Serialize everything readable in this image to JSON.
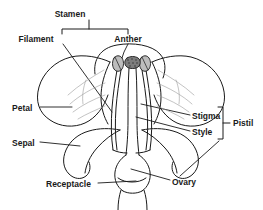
{
  "diagram": {
    "style": "black and white line art",
    "colors": {
      "outline": "#1a1a1a",
      "leader": "#1a1a1a",
      "vein": "#9a9a9a",
      "anther_fill": "#8c8c8c",
      "stigma_fill": "#6e6e6e",
      "background": "#ffffff"
    },
    "labels": [
      {
        "id": "stamen",
        "text": "Stamen",
        "x": 89,
        "y": 14,
        "anchor": "middle"
      },
      {
        "id": "filament",
        "text": "Filament",
        "x": 62,
        "y": 39,
        "anchor": "middle"
      },
      {
        "id": "anther",
        "text": "Anther",
        "x": 128,
        "y": 39,
        "anchor": "middle"
      },
      {
        "id": "petal",
        "text": "Petal",
        "x": 12,
        "y": 108,
        "anchor": "start"
      },
      {
        "id": "sepal",
        "text": "Sepal",
        "x": 12,
        "y": 143,
        "anchor": "start"
      },
      {
        "id": "receptacle",
        "text": "Receptacle",
        "x": 46,
        "y": 184,
        "anchor": "start"
      },
      {
        "id": "stigma",
        "text": "Stigma",
        "x": 193,
        "y": 117,
        "anchor": "start"
      },
      {
        "id": "style",
        "text": "Style",
        "x": 193,
        "y": 133,
        "anchor": "start"
      },
      {
        "id": "ovary",
        "text": "Ovary",
        "x": 172,
        "y": 182,
        "anchor": "start"
      },
      {
        "id": "pistil",
        "text": "Pistil",
        "x": 232,
        "y": 122,
        "anchor": "start"
      }
    ],
    "brackets": [
      {
        "id": "stamen-bracket",
        "orientation": "horizontal",
        "from": 62,
        "to": 128,
        "line": 29,
        "stem_to": 20
      },
      {
        "id": "pistil-bracket",
        "orientation": "vertical",
        "from": 107,
        "to": 139,
        "line": 223,
        "stem_to": 230
      }
    ],
    "parts": [
      {
        "id": "petal-left",
        "name": "Petal"
      },
      {
        "id": "petal-right",
        "name": "Petal"
      },
      {
        "id": "petal-back",
        "name": "Petal"
      },
      {
        "id": "sepal-left",
        "name": "Sepal"
      },
      {
        "id": "sepal-right",
        "name": "Sepal"
      },
      {
        "id": "anther-left",
        "name": "Anther"
      },
      {
        "id": "anther-right",
        "name": "Anther"
      },
      {
        "id": "filament-left",
        "name": "Filament"
      },
      {
        "id": "filament-right",
        "name": "Filament"
      },
      {
        "id": "stigma",
        "name": "Stigma"
      },
      {
        "id": "style",
        "name": "Style"
      },
      {
        "id": "ovary",
        "name": "Ovary"
      },
      {
        "id": "receptacle",
        "name": "Receptacle"
      },
      {
        "id": "stem",
        "name": "Stem"
      }
    ]
  }
}
